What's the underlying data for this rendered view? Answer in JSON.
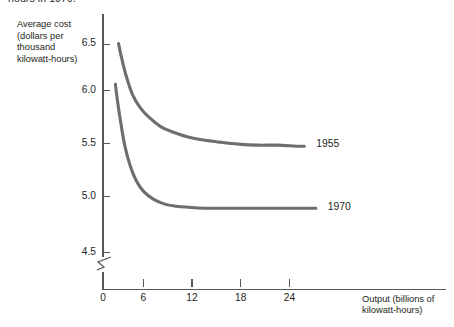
{
  "figure": {
    "caption_tail": "hours in 1970.",
    "line_color": "#6d6e71",
    "axis_color": "#58595b",
    "text_color": "#231f20"
  },
  "chart_data": {
    "type": "line",
    "title": "",
    "subtitle": "",
    "xlabel": "Output (billions of kilowatt-hours)",
    "ylabel": "Average cost (dollars per thousand kilowatt-hours)",
    "ylabel_lines": [
      "Average cost",
      "(dollars per",
      "thousand",
      "kilowatt-hours)"
    ],
    "xlabel_lines": [
      "Output (billions of",
      "kilowatt-hours)"
    ],
    "grid": false,
    "legend_position": "at-curve-end",
    "y_axis_break": true,
    "xlim": [
      0,
      30
    ],
    "ylim": [
      4.3,
      6.7
    ],
    "xticks": [
      0,
      6,
      12,
      18,
      24
    ],
    "xtick_labels": [
      "0",
      "6",
      "12",
      "18",
      "24"
    ],
    "yticks": [
      6.5,
      6.0,
      5.5,
      5.0,
      4.5
    ],
    "ytick_labels": [
      "6.5",
      "6.0",
      "5.5",
      "5.0",
      "4.5"
    ],
    "series": [
      {
        "name": "1955",
        "label": "1955",
        "plateau_value": 5.5,
        "x": [
          2.0,
          2.4,
          3.0,
          3.8,
          4.8,
          6.0,
          7.5,
          9.0,
          11.0,
          13.0,
          15.0,
          17.5,
          20.0,
          22.5,
          25.0,
          26.0
        ],
        "values": [
          6.5,
          6.36,
          6.18,
          6.0,
          5.87,
          5.77,
          5.68,
          5.63,
          5.58,
          5.55,
          5.53,
          5.51,
          5.5,
          5.5,
          5.49,
          5.49
        ]
      },
      {
        "name": "1970",
        "label": "1970",
        "plateau_value": 4.88,
        "x": [
          1.6,
          1.9,
          2.3,
          2.8,
          3.5,
          4.3,
          5.3,
          6.5,
          8.0,
          9.5,
          11.0,
          13.0,
          15.5,
          18.0,
          21.0,
          24.0,
          26.5,
          27.5
        ],
        "values": [
          6.1,
          5.92,
          5.72,
          5.5,
          5.3,
          5.15,
          5.04,
          4.97,
          4.92,
          4.9,
          4.89,
          4.88,
          4.88,
          4.88,
          4.88,
          4.88,
          4.88,
          4.88
        ]
      }
    ],
    "annotations": [
      {
        "text": "1955",
        "x": 26.5,
        "y": 5.5
      },
      {
        "text": "1970",
        "x": 28.0,
        "y": 4.88
      }
    ]
  }
}
